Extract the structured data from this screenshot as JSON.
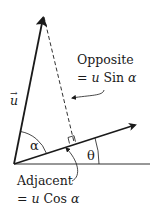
{
  "diagram": {
    "type": "vector-resolution",
    "colors": {
      "stroke": "#1a1a1a",
      "background": "#ffffff"
    },
    "vector_label": "u",
    "vector_arrow_mark": "→",
    "angle_alpha": "α",
    "angle_theta": "θ",
    "opposite": {
      "title": "Opposite",
      "eq_prefix": "= ",
      "eq_var": "u",
      "eq_func": " Sin ",
      "eq_angle": "α"
    },
    "adjacent": {
      "title": "Adjacent",
      "eq_prefix": "= ",
      "eq_var": "u",
      "eq_func": " Cos ",
      "eq_angle": "α"
    }
  }
}
